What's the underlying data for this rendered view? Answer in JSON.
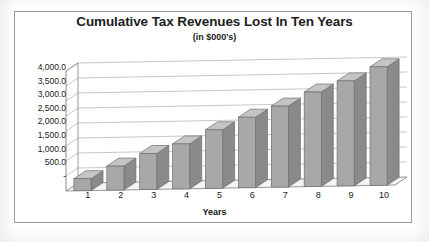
{
  "chart_data": {
    "type": "bar",
    "title": "Cumulative Tax Revenues Lost In Ten Years",
    "subtitle": "(in $000's)",
    "xlabel": "Years",
    "ylabel": "",
    "categories": [
      "1",
      "2",
      "3",
      "4",
      "5",
      "6",
      "7",
      "8",
      "9",
      "10"
    ],
    "values": [
      400.0,
      800.0,
      1200.0,
      1500.0,
      1950.0,
      2350.0,
      2700.0,
      3150.0,
      3500.0,
      3950.0
    ],
    "ylim": [
      0,
      4000
    ],
    "ytick_labels": [
      "4,000.0",
      "3,500.0",
      "3,000.0",
      "2,500.0",
      "2,000.0",
      "1,500.0",
      "1,000.0",
      "500.0"
    ],
    "ytick_values": [
      4000,
      3500,
      3000,
      2500,
      2000,
      1500,
      1000,
      500
    ],
    "y_zero_label": "-",
    "grid": true,
    "legend": false,
    "style": "3d-column",
    "series": [
      {
        "name": "Cumulative Tax Revenues Lost",
        "values": [
          400.0,
          800.0,
          1200.0,
          1500.0,
          1950.0,
          2350.0,
          2700.0,
          3150.0,
          3500.0,
          3950.0
        ]
      }
    ]
  },
  "colors": {
    "bar_front": "#a8a8a8",
    "bar_side": "#8a8a8a",
    "bar_top": "#c4c4c4",
    "bar_outline": "#6f6f6f",
    "gridline": "#b9b9b9",
    "axis_line": "#7d7d7d",
    "floor": "#f4f4f4",
    "text": "#1a1a1a",
    "frame": "#9a9a9a",
    "plot_background": "#ffffff"
  }
}
